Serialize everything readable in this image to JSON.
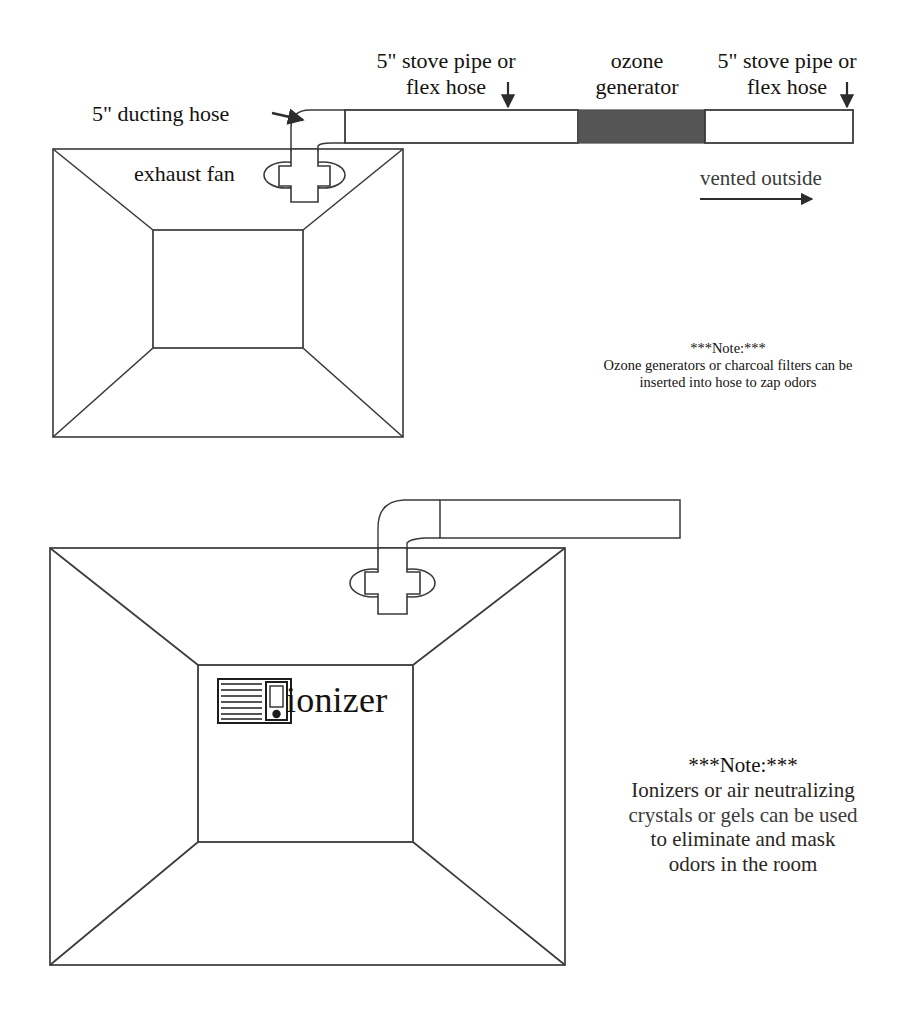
{
  "document": {
    "title": "Grow room exhaust ventilation diagram",
    "type": "line-diagram"
  },
  "colors": {
    "line": "#3a3a3a",
    "ink": "#15120f",
    "ozone_generator_fill": "#555555",
    "background": "#ffffff"
  },
  "top_diagram": {
    "labels": {
      "ducting_hose": "5\" ducting hose",
      "exhaust_fan": "exhaust fan",
      "stove_pipe_left_line1": "5\" stove pipe or",
      "stove_pipe_left_line2": "flex hose",
      "ozone_generator_line1": "ozone",
      "ozone_generator_line2": "generator",
      "stove_pipe_right_line1": "5\" stove pipe or",
      "stove_pipe_right_line2": "flex hose",
      "vented_outside": "vented outside"
    },
    "note": {
      "heading": "***Note:***",
      "line1": "Ozone generators or charcoal filters can be",
      "line2": "inserted into hose to zap odors"
    },
    "icons": {
      "ducting_arrow": "arrow-right-icon",
      "stove_pipe_left_arrow": "arrow-down-icon",
      "stove_pipe_right_arrow": "arrow-down-icon",
      "vent_arrow": "arrow-right-icon",
      "fan": "exhaust-fan-icon",
      "room": "room-perspective-icon"
    }
  },
  "bottom_diagram": {
    "labels": {
      "ionizer": "ionizer"
    },
    "note": {
      "heading": "***Note:***",
      "line1": "Ionizers or air neutralizing",
      "line2": "crystals or gels can be used",
      "line3": "to eliminate and mask",
      "line4": "odors in the room"
    },
    "icons": {
      "fan": "exhaust-fan-icon",
      "ionizer": "ionizer-appliance-icon",
      "room": "room-perspective-icon"
    }
  }
}
